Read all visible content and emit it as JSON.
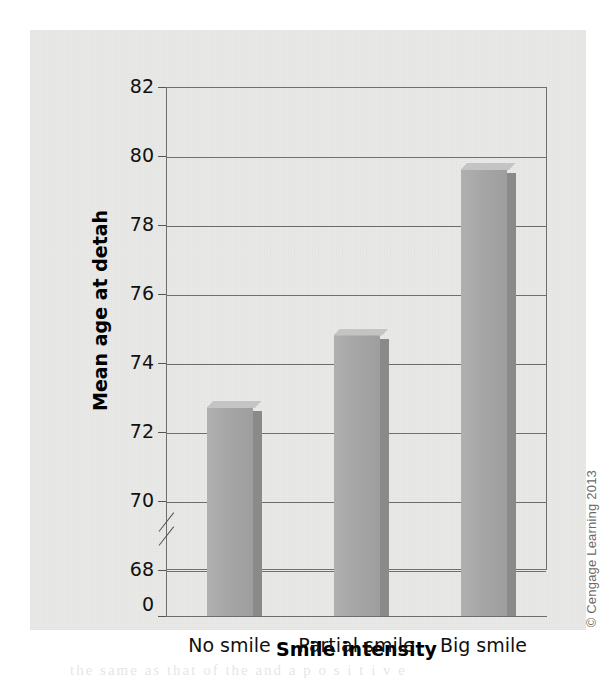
{
  "figure": {
    "copyright": "© Cengage Learning 2013",
    "ghost_text": "the same as that of the                    and a  p o s i t i v e"
  },
  "chart_data": {
    "type": "bar",
    "title": "",
    "xlabel": "Smile intensity",
    "ylabel": "Mean age at detah",
    "categories": [
      "No smile",
      "Partial smile",
      "Big smile"
    ],
    "values": [
      72.9,
      75.0,
      79.8
    ],
    "ylim": [
      68,
      82
    ],
    "yticks": [
      0,
      68,
      70,
      72,
      74,
      76,
      78,
      80,
      82
    ],
    "ytick_labels": [
      "0",
      "68",
      "70",
      "72",
      "74",
      "76",
      "78",
      "80",
      "82"
    ],
    "axis_break": true,
    "axis_break_between": [
      0,
      68
    ],
    "grid": true,
    "grid_axis": "y",
    "legend": false,
    "bar_color": "#a6a6a6",
    "bar_side_color": "#8a8a8a",
    "bar_top_color": "#c4c4c4",
    "grid_color": "#6e6e6e",
    "background_color": "#e9e9e7"
  }
}
